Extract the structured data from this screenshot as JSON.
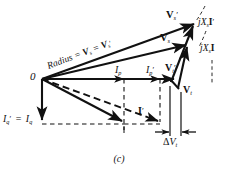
{
  "figure": {
    "caption": "(c)",
    "type": "phasor-diagram",
    "origin_label": "0"
  },
  "labels": {
    "radius": {
      "text_parts": [
        "Radius",
        "=",
        "V",
        "s",
        "=",
        "V",
        "s"
      ],
      "full": "Radius = Vs = V's",
      "prefix": "Radius",
      "eq1": "=",
      "v1": "V",
      "v1_sub": "s",
      "eq2": "=",
      "v2": "V",
      "v2_sub": "s",
      "prime": "′"
    },
    "vs_prime": {
      "base": "V",
      "sub": "s",
      "prime": "′"
    },
    "vs": {
      "base": "V",
      "sub": "s",
      "prime": ""
    },
    "jxs_i_prime": {
      "j": "j",
      "x": "X",
      "x_sub": "s",
      "i": "I",
      "prime": "′"
    },
    "jxs_i": {
      "j": "j",
      "x": "X",
      "x_sub": "s",
      "i": "I",
      "prime": ""
    },
    "vt_prime": {
      "base": "V",
      "sub": "t",
      "prime": "′"
    },
    "vt": {
      "base": "V",
      "sub": "t",
      "prime": ""
    },
    "ip": {
      "base": "I",
      "sub": "p",
      "prime": ""
    },
    "ip_prime": {
      "base": "I",
      "sub": "p",
      "prime": "′"
    },
    "iq_prime": {
      "base": "I",
      "sub": "q",
      "prime": "′"
    },
    "iq": {
      "base": "I",
      "sub": "q",
      "prime": ""
    },
    "iq_equals": "=",
    "i_prime": {
      "base": "I",
      "sub": "",
      "prime": "′"
    },
    "delta_vt": {
      "delta": "Δ",
      "base": "V",
      "sub": "t"
    }
  },
  "colors": {
    "ink": "#111111",
    "background": "#ffffff",
    "dashed": "#222222"
  },
  "geometry": {
    "origin": {
      "x": 42,
      "y": 79
    },
    "vt_point": {
      "x": 172,
      "y": 79
    },
    "vt_tip": {
      "x": 182,
      "y": 88
    },
    "vs_tip": {
      "x": 188,
      "y": 43
    },
    "vs_prime_tip": {
      "x": 196,
      "y": 22
    },
    "ip_tick": {
      "x": 124,
      "y": 79
    },
    "ip_prime_tick": {
      "x": 160,
      "y": 79
    },
    "iq_level_y": 124,
    "delta_vt_span": {
      "x1": 170,
      "x2": 188,
      "y": 140
    }
  }
}
